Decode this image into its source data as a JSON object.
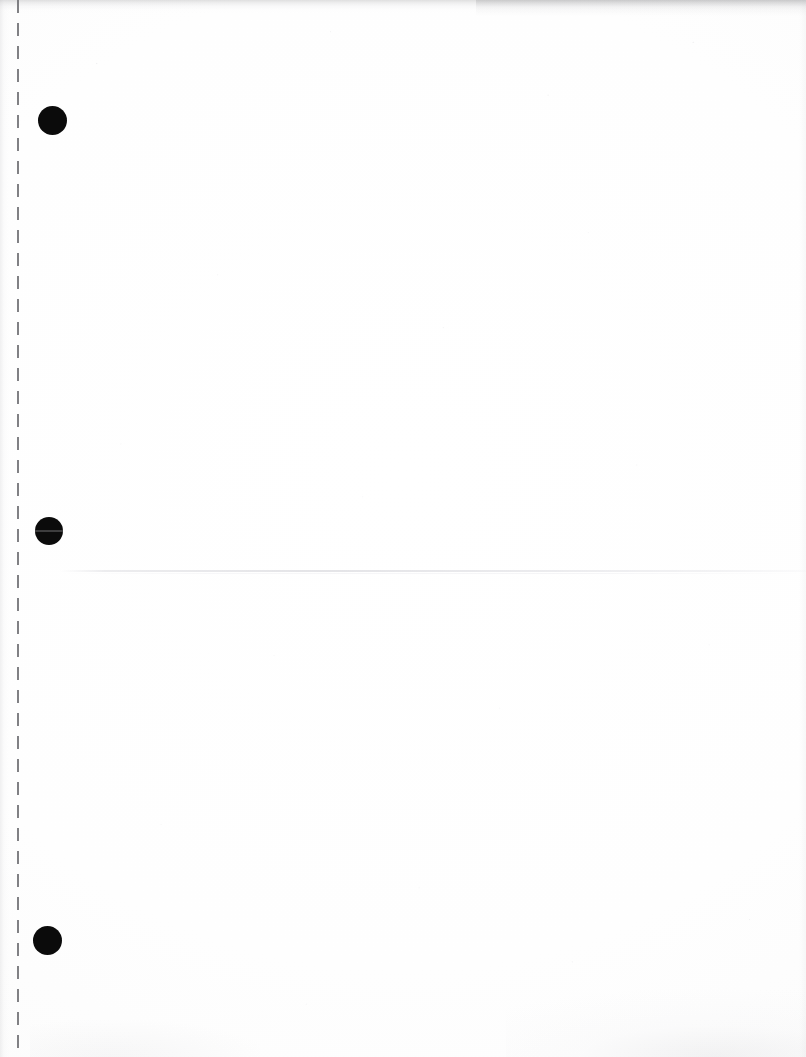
{
  "document": {
    "kind": "scanned-page",
    "content_text": "",
    "page_background_color": "#fdfdfd",
    "width_px": 806,
    "height_px": 1057
  },
  "perforation": {
    "name": "tear-off-dashed-line",
    "orientation": "vertical",
    "x_px": 17,
    "dash_length_px": 13,
    "gap_length_px": 10,
    "color": "#76767a"
  },
  "punch_holes": [
    {
      "label": "hole-1",
      "x_px": 52,
      "y_px": 120,
      "diameter_px": 29,
      "color": "#0b0b0b"
    },
    {
      "label": "hole-2",
      "x_px": 49,
      "y_px": 531,
      "diameter_px": 28,
      "color": "#0b0b0b"
    },
    {
      "label": "hole-3",
      "x_px": 47,
      "y_px": 940,
      "diameter_px": 29,
      "color": "#0b0b0b"
    }
  ],
  "fold_crease": {
    "label": "horizontal-fold-crease",
    "y_px": 571,
    "color": "#d4d4d9"
  },
  "scan_artifacts": {
    "top_edge_shadow_color": "#96969a",
    "left_edge_shadow_color": "#bebec1",
    "bottom_right_mottle_color": "#c8c8cb",
    "speckle_color": "#d8d8dc"
  }
}
